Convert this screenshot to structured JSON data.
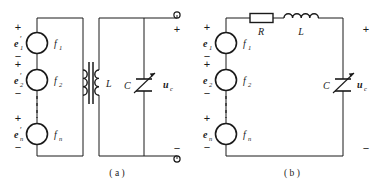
{
  "figure": {
    "background_color": "#ffffff",
    "line_color": "#1a1a1a",
    "width": 378,
    "height": 187,
    "circuits": [
      {
        "id": "circuit-a",
        "caption": "( a )",
        "sources": [
          {
            "emf_label": "e",
            "emf_sub": "1",
            "emf_prime": "′",
            "freq_label": "f",
            "freq_sub": "1",
            "plus": "+",
            "minus": "−"
          },
          {
            "emf_label": "e",
            "emf_sub": "2",
            "emf_prime": "′",
            "freq_label": "f",
            "freq_sub": "2",
            "plus": "+",
            "minus": "−"
          },
          {
            "emf_label": "e",
            "emf_sub": "n",
            "emf_prime": "′",
            "freq_label": "f",
            "freq_sub": "n",
            "plus": "+",
            "minus": "−"
          }
        ],
        "ellipsis": "vertical-dashed",
        "components": [
          {
            "name": "transformer",
            "label": "",
            "type": "transformer"
          },
          {
            "name": "inductor",
            "label": "L",
            "type": "coil-secondary"
          },
          {
            "name": "capacitor",
            "label": "C",
            "type": "variable-capacitor"
          }
        ],
        "output": {
          "voltage_label": "u",
          "voltage_sub": "c",
          "terminal_top_sign": "+",
          "terminal_bottom_sign": "−",
          "terminal_style": "open-circle"
        }
      },
      {
        "id": "circuit-b",
        "caption": "( b )",
        "sources": [
          {
            "emf_label": "e",
            "emf_sub": "1",
            "emf_prime": "",
            "freq_label": "f",
            "freq_sub": "1",
            "plus": "+",
            "minus": "−"
          },
          {
            "emf_label": "e",
            "emf_sub": "2",
            "emf_prime": "",
            "freq_label": "f",
            "freq_sub": "2",
            "plus": "+",
            "minus": "−"
          },
          {
            "emf_label": "e",
            "emf_sub": "n",
            "emf_prime": "",
            "freq_label": "f",
            "freq_sub": "n",
            "plus": "+",
            "minus": "−"
          }
        ],
        "ellipsis": "vertical-dashed",
        "components": [
          {
            "name": "resistor",
            "label": "R",
            "type": "box-resistor"
          },
          {
            "name": "inductor",
            "label": "L",
            "type": "coil-inductor"
          },
          {
            "name": "capacitor",
            "label": "C",
            "type": "variable-capacitor"
          }
        ],
        "output": {
          "voltage_label": "u",
          "voltage_sub": "c",
          "terminal_top_sign": "+",
          "terminal_bottom_sign": "−",
          "terminal_style": "none"
        }
      }
    ]
  }
}
